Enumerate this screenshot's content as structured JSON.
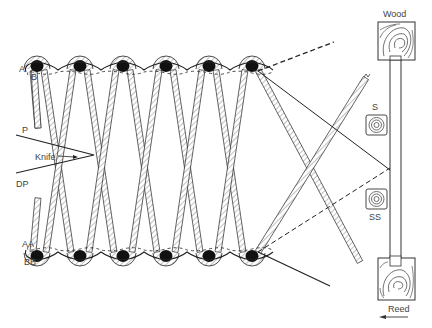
{
  "diagram": {
    "labels": {
      "a": "A",
      "b": "B",
      "p": "P",
      "knife": "Knife",
      "dp": "DP",
      "aa": "AA",
      "bb": "BB",
      "s": "S",
      "ss": "SS",
      "wood": "Wood",
      "reed": "Reed"
    },
    "top_row_knots": 6,
    "bottom_row_knots": 6,
    "colors": {
      "ink": "#222222",
      "knot": "#111111",
      "hatch": "#999999",
      "label": "#444444"
    }
  }
}
